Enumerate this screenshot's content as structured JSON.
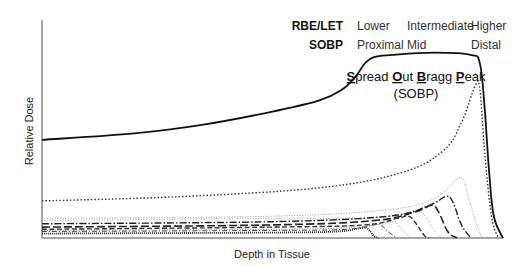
{
  "chart_data": {
    "type": "line",
    "title": "Spread Out Bragg Peak (SOBP)",
    "title_parts": [
      {
        "bold": "S",
        "rest": "pread "
      },
      {
        "bold": "O",
        "rest": "ut "
      },
      {
        "bold": "B",
        "rest": "ragg "
      },
      {
        "bold": "P",
        "rest": "eak"
      }
    ],
    "subtitle": "(SOBP)",
    "xlabel": "Depth in Tissue",
    "ylabel": "Relative Dose",
    "grid": false,
    "ticks": false,
    "header_rows": [
      {
        "label": "RBE/LET",
        "values": [
          "Lower",
          "Intermediate",
          "Higher"
        ]
      },
      {
        "label": "SOBP",
        "values": [
          "Proximal",
          "Mid",
          "Distal"
        ]
      }
    ],
    "series": [
      {
        "name": "SOBP (sum)",
        "style": "solid-thick",
        "color": "#111111",
        "points": [
          [
            0,
            0.45
          ],
          [
            0.2,
            0.48
          ],
          [
            0.35,
            0.52
          ],
          [
            0.5,
            0.58
          ],
          [
            0.6,
            0.63
          ],
          [
            0.65,
            0.68
          ],
          [
            0.68,
            0.74
          ],
          [
            0.7,
            0.8
          ],
          [
            0.72,
            0.83
          ],
          [
            0.76,
            0.84
          ],
          [
            0.85,
            0.85
          ],
          [
            0.93,
            0.84
          ],
          [
            0.95,
            0.8
          ],
          [
            0.96,
            0.6
          ],
          [
            0.97,
            0.3
          ],
          [
            0.98,
            0.1
          ],
          [
            1.0,
            0.0
          ]
        ]
      },
      {
        "name": "Bragg peak 1 (deepest, largest)",
        "style": "dotted-dark",
        "color": "#333333",
        "points": [
          [
            0,
            0.17
          ],
          [
            0.3,
            0.19
          ],
          [
            0.6,
            0.23
          ],
          [
            0.78,
            0.3
          ],
          [
            0.87,
            0.4
          ],
          [
            0.91,
            0.53
          ],
          [
            0.94,
            0.7
          ],
          [
            0.95,
            0.68
          ],
          [
            0.96,
            0.4
          ],
          [
            0.975,
            0.1
          ],
          [
            0.99,
            0.0
          ]
        ]
      },
      {
        "name": "Bragg peak 2",
        "style": "dotted-light",
        "color": "#999999",
        "points": [
          [
            0,
            0.09
          ],
          [
            0.5,
            0.1
          ],
          [
            0.75,
            0.13
          ],
          [
            0.85,
            0.18
          ],
          [
            0.9,
            0.27
          ],
          [
            0.915,
            0.26
          ],
          [
            0.93,
            0.15
          ],
          [
            0.95,
            0.02
          ],
          [
            0.96,
            0.0
          ]
        ]
      },
      {
        "name": "Bragg peak 3",
        "style": "dash-dot",
        "color": "#222222",
        "points": [
          [
            0,
            0.065
          ],
          [
            0.5,
            0.075
          ],
          [
            0.75,
            0.1
          ],
          [
            0.84,
            0.15
          ],
          [
            0.875,
            0.19
          ],
          [
            0.89,
            0.17
          ],
          [
            0.91,
            0.06
          ],
          [
            0.93,
            0.0
          ]
        ]
      },
      {
        "name": "Bragg peak 4",
        "style": "long-dash",
        "color": "#222222",
        "points": [
          [
            0,
            0.05
          ],
          [
            0.5,
            0.06
          ],
          [
            0.72,
            0.08
          ],
          [
            0.81,
            0.12
          ],
          [
            0.845,
            0.15
          ],
          [
            0.86,
            0.12
          ],
          [
            0.88,
            0.03
          ],
          [
            0.9,
            0.0
          ]
        ]
      },
      {
        "name": "Bragg peak 5",
        "style": "dotted-light",
        "color": "#aaaaaa",
        "points": [
          [
            0,
            0.08
          ],
          [
            0.5,
            0.09
          ],
          [
            0.7,
            0.09
          ],
          [
            0.79,
            0.11
          ],
          [
            0.82,
            0.12
          ],
          [
            0.835,
            0.09
          ],
          [
            0.855,
            0.02
          ],
          [
            0.87,
            0.0
          ]
        ]
      },
      {
        "name": "Bragg peak 6",
        "style": "dash",
        "color": "#333333",
        "points": [
          [
            0,
            0.04
          ],
          [
            0.5,
            0.05
          ],
          [
            0.7,
            0.06
          ],
          [
            0.77,
            0.09
          ],
          [
            0.795,
            0.1
          ],
          [
            0.81,
            0.07
          ],
          [
            0.83,
            0.01
          ],
          [
            0.84,
            0.0
          ]
        ]
      },
      {
        "name": "Bragg peak 7",
        "style": "dotted-light",
        "color": "#888888",
        "points": [
          [
            0,
            0.035
          ],
          [
            0.5,
            0.04
          ],
          [
            0.68,
            0.05
          ],
          [
            0.745,
            0.07
          ],
          [
            0.765,
            0.075
          ],
          [
            0.78,
            0.04
          ],
          [
            0.8,
            0.0
          ]
        ]
      },
      {
        "name": "Bragg peak 8",
        "style": "dash-dot-thin",
        "color": "#444444",
        "points": [
          [
            0,
            0.03
          ],
          [
            0.5,
            0.035
          ],
          [
            0.66,
            0.04
          ],
          [
            0.72,
            0.06
          ],
          [
            0.735,
            0.06
          ],
          [
            0.75,
            0.03
          ],
          [
            0.77,
            0.0
          ]
        ]
      },
      {
        "name": "Bragg peak 9",
        "style": "dotted-dense",
        "color": "#222222",
        "points": [
          [
            0,
            0.02
          ],
          [
            0.5,
            0.025
          ],
          [
            0.64,
            0.03
          ],
          [
            0.69,
            0.045
          ],
          [
            0.705,
            0.045
          ],
          [
            0.72,
            0.01
          ],
          [
            0.73,
            0.0
          ]
        ]
      }
    ],
    "xlim": [
      0,
      1
    ],
    "ylim": [
      0,
      1
    ]
  }
}
